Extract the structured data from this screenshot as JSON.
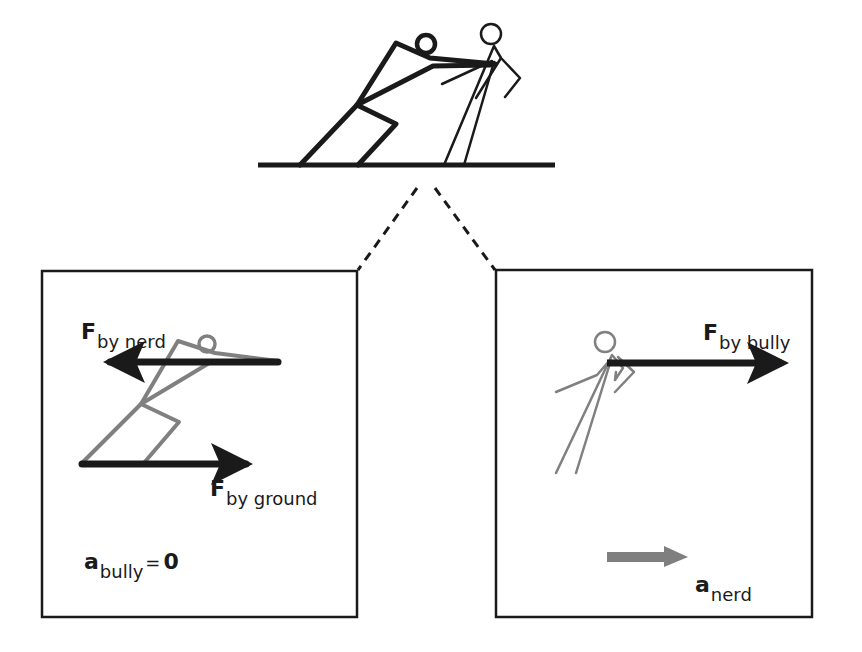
{
  "diagram": {
    "type": "free-body-diagram",
    "colors": {
      "ink": "#1a1a1a",
      "figure_gray": "#808080",
      "accel_arrow": "#7f7f7f",
      "background": "#ffffff"
    },
    "top_scene": {
      "description": "Bully pushing nerd; both standing on ground line",
      "figures": [
        "bully",
        "nerd"
      ]
    },
    "left_panel": {
      "subject": "bully",
      "forces": [
        {
          "symbol": "F",
          "subscript": "by nerd",
          "direction": "left"
        },
        {
          "symbol": "F",
          "subscript": "by ground",
          "direction": "right"
        }
      ],
      "acceleration": {
        "symbol": "a",
        "subscript": "bully",
        "equals": "=",
        "value": "0"
      }
    },
    "right_panel": {
      "subject": "nerd",
      "forces": [
        {
          "symbol": "F",
          "subscript": "by bully",
          "direction": "right"
        }
      ],
      "acceleration": {
        "symbol": "a",
        "subscript": "nerd",
        "direction": "right"
      }
    }
  }
}
